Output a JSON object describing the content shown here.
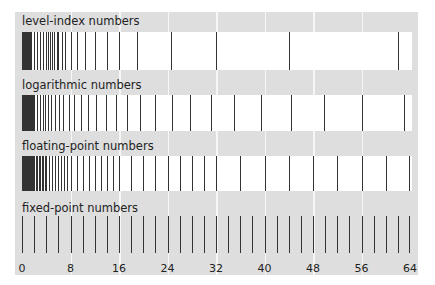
{
  "chart_data": {
    "type": "strip-plot",
    "title": "",
    "xlabel": "",
    "ylabel": "",
    "xlim": [
      0,
      64
    ],
    "x_ticks": [
      0,
      8,
      16,
      24,
      32,
      40,
      48,
      56,
      64
    ],
    "grid": true,
    "rows": [
      {
        "name": "level-index numbers",
        "values": [
          0,
          0.5,
          1,
          1.5,
          2,
          2.5,
          3,
          3.5,
          4,
          4.3,
          4.6,
          5,
          5.3,
          5.7,
          6,
          6.6,
          7.1,
          8,
          9,
          10.4,
          12,
          14,
          16,
          19,
          24.5,
          32,
          44,
          62
        ]
      },
      {
        "name": "logarithmic numbers",
        "values": [
          0,
          0.5,
          1,
          1.5,
          2,
          2.5,
          3,
          3.4,
          3.8,
          4.3,
          4.8,
          5.4,
          6.1,
          6.8,
          7.7,
          8.6,
          9.7,
          10.9,
          12.2,
          13.8,
          15.5,
          17.4,
          19.5,
          22,
          24.7,
          27.7,
          31.2,
          35,
          39.4,
          44.3,
          49.8,
          56,
          63
        ]
      },
      {
        "name": "floating-point numbers",
        "values": "0-2 dense, 2-4 step 0.25, 4-8 step 0.5, 8-16 step 1, 16-32 step 2, 32-64 step 4"
      },
      {
        "name": "fixed-point numbers",
        "values": "0-64 step 2"
      }
    ]
  },
  "labels": {
    "row1": "level-index numbers",
    "row2": "logarithmic numbers",
    "row3": "floating-point numbers",
    "row4": "fixed-point numbers"
  },
  "axis": [
    "0",
    "8",
    "16",
    "24",
    "32",
    "40",
    "48",
    "56",
    "64"
  ]
}
